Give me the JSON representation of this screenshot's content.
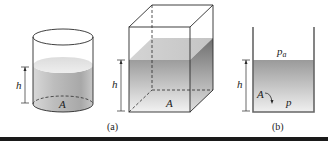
{
  "figure": {
    "cylinder": {
      "height_label": "h",
      "area_label": "A"
    },
    "box": {
      "height_label": "h",
      "area_label": "A",
      "caption": "(a)"
    },
    "open_container": {
      "height_label": "h",
      "area_label": "A",
      "surface_pressure_label": "p",
      "surface_pressure_subscript": "a",
      "bottom_pressure_label": "p",
      "caption": "(b)"
    }
  },
  "colors": {
    "outline": "#2a2a2a",
    "liquid_light": "#e6e6e6",
    "liquid_dark": "#9a9a9a",
    "bottom_rule": "#1a1a1a"
  }
}
